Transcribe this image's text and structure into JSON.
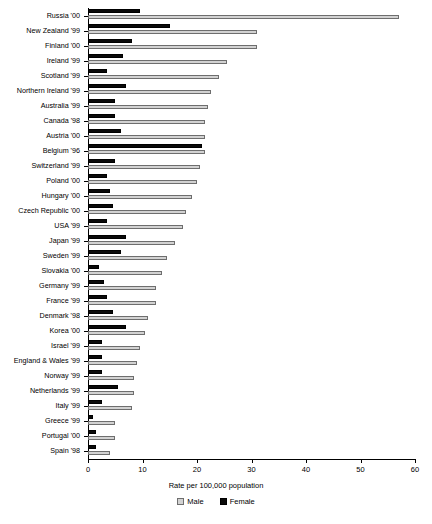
{
  "chart_data": {
    "type": "bar",
    "orientation": "horizontal",
    "title": "",
    "xlabel": "Rate per 100,000 population",
    "ylabel": "",
    "xlim": [
      0,
      60
    ],
    "xticks": [
      0,
      10,
      20,
      30,
      40,
      50,
      60
    ],
    "xticklabels": [
      "0",
      "10",
      "20",
      "30",
      "40",
      "50",
      "60"
    ],
    "grid": false,
    "legend_position": "bottom",
    "categories": [
      "Russia '00",
      "New Zealand '99",
      "Finland '00",
      "Ireland '99",
      "Scotland '99",
      "Northern Ireland '99",
      "Australia '99",
      "Canada '98",
      "Austria '00",
      "Belgium '96",
      "Switzerland '99",
      "Poland '00",
      "Hungary '00",
      "Czech Republic '00",
      "USA '99",
      "Japan '99",
      "Sweden '99",
      "Slovakia '00",
      "Germany '99",
      "France '99",
      "Denmark '98",
      "Korea '00",
      "Israel '99",
      "England & Wales '99",
      "Norway '99",
      "Netherlands '99",
      "Italy '99",
      "Greece '99",
      "Portugal '00",
      "Spain '98"
    ],
    "series": [
      {
        "name": "Male",
        "color": "#d2d2d2",
        "values": [
          57.0,
          31.0,
          31.0,
          25.5,
          24.0,
          22.5,
          22.0,
          21.5,
          21.5,
          21.5,
          20.5,
          20.0,
          19.0,
          18.0,
          17.5,
          16.0,
          14.5,
          13.5,
          12.5,
          12.5,
          11.0,
          10.5,
          9.5,
          9.0,
          8.5,
          8.5,
          8.0,
          5.0,
          5.0,
          4.0
        ]
      },
      {
        "name": "Female",
        "color": "#0a0a0a",
        "values": [
          9.5,
          15.0,
          8.0,
          6.5,
          3.5,
          7.0,
          5.0,
          5.0,
          6.0,
          21.0,
          5.0,
          3.5,
          4.0,
          4.5,
          3.5,
          7.0,
          6.0,
          2.0,
          3.0,
          3.5,
          4.5,
          7.0,
          2.5,
          2.5,
          2.5,
          5.5,
          2.5,
          1.0,
          1.5,
          1.5
        ]
      }
    ]
  },
  "legend": {
    "items": [
      {
        "label": "Male",
        "swatch": "male"
      },
      {
        "label": "Female",
        "swatch": "female"
      }
    ]
  }
}
